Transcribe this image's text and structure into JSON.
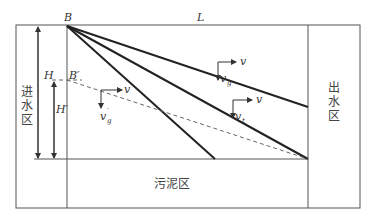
{
  "diagram": {
    "labels": {
      "B": "B",
      "L": "L",
      "H": "H",
      "B_prime": "B′",
      "H_prime": "H′",
      "v_top": "v",
      "v_mid": "v",
      "v_low": "v",
      "vg": "v",
      "vg_sub": "g",
      "vt": "v",
      "vt_sub": "t",
      "vg_prime": "v",
      "vg_prime_sub": "g",
      "vg_prime_sup": "′"
    },
    "zones": {
      "inlet": [
        "进",
        "水",
        "区"
      ],
      "outlet": [
        "出",
        "水",
        "区"
      ],
      "sludge": "污泥区"
    }
  }
}
